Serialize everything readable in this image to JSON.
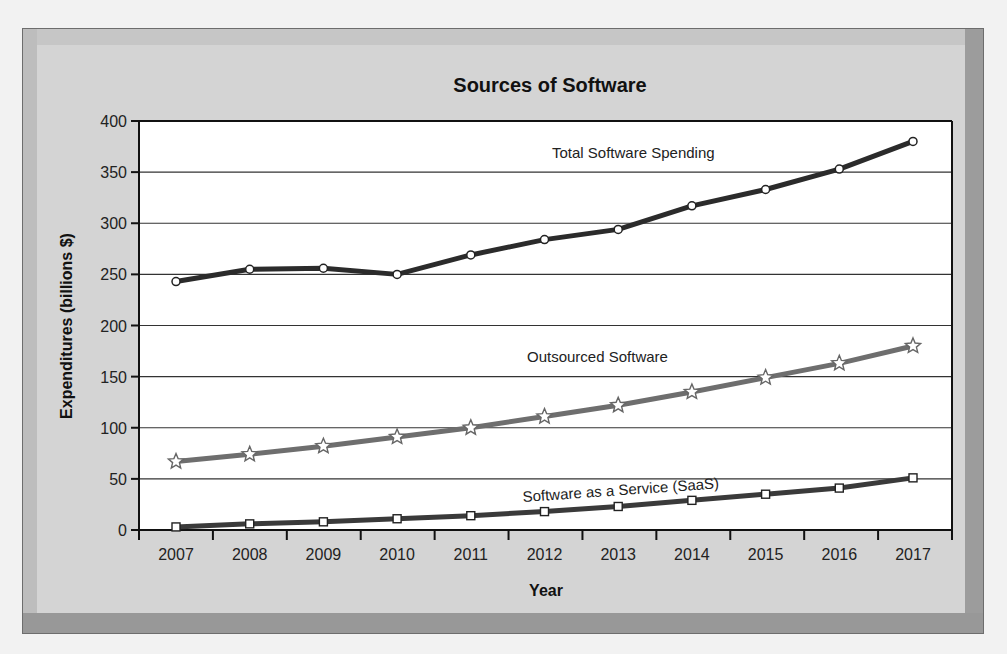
{
  "chart_data": {
    "type": "line",
    "title": "Sources of Software",
    "xlabel": "Year",
    "ylabel": "Expenditures (billions $)",
    "ylim": [
      0,
      400
    ],
    "yticks": [
      0,
      50,
      100,
      150,
      200,
      250,
      300,
      350,
      400
    ],
    "grid": true,
    "legend_position": "inline labels",
    "x": [
      "2007",
      "2008",
      "2009",
      "2010",
      "2011",
      "2012",
      "2013",
      "2014",
      "2015",
      "2016",
      "2017"
    ],
    "series": [
      {
        "name": "Total Software Spending",
        "marker": "circle",
        "color": "#2b2b2b",
        "values": [
          243,
          255,
          256,
          250,
          269,
          284,
          294,
          317,
          333,
          353,
          380
        ]
      },
      {
        "name": "Outsourced Software",
        "marker": "star",
        "color": "#6e6e6e",
        "values": [
          67,
          74,
          82,
          91,
          100,
          111,
          122,
          135,
          149,
          163,
          180
        ]
      },
      {
        "name": "Software as a Service (SaaS)",
        "marker": "square",
        "color": "#3a3a3a",
        "values": [
          3,
          6,
          8,
          11,
          14,
          18,
          23,
          29,
          35,
          41,
          51
        ]
      }
    ]
  },
  "labels": {
    "title": "Sources of Software",
    "xlabel": "Year",
    "ylabel": "Expenditures (billions $)",
    "series_total": "Total Software Spending",
    "series_outsourced": "Outsourced Software",
    "series_saas": "Software as a Service (SaaS)"
  }
}
